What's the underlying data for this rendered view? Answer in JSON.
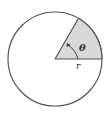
{
  "diagram": {
    "type": "circle-sector",
    "angle_label": "θ",
    "radius_label": "r",
    "colors": {
      "stroke": "#555555",
      "sector_fill": "#d9d9d9",
      "background": "#ffffff"
    }
  }
}
